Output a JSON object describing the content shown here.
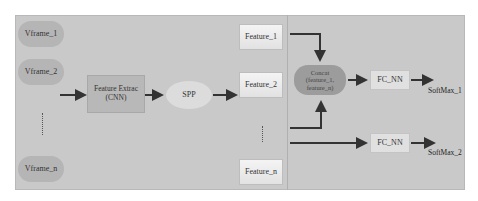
{
  "diagram": {
    "inputs": [
      {
        "label": "Vframe_1"
      },
      {
        "label": "Vframe_2"
      },
      {
        "label": "Vframe_n"
      }
    ],
    "feature_extractor": {
      "line1": "Feature Extrac",
      "line2": "(CNN)"
    },
    "spp": {
      "label": "SPP"
    },
    "features": [
      {
        "label": "Feature_1"
      },
      {
        "label": "Feature_2"
      },
      {
        "label": "Feature_n"
      }
    ],
    "concat": {
      "line1": "Concat",
      "line2": "(feature_1,",
      "line3": "feature_n)"
    },
    "fc_nodes": [
      {
        "label": "FC_NN"
      },
      {
        "label": "FC_NN"
      }
    ],
    "outputs": [
      {
        "label": "SoftMax_1"
      },
      {
        "label": "SoftMax_2"
      }
    ],
    "colors": {
      "canvas": "#c9c9c9",
      "vframe": "#b5b5b5",
      "concat": "#9c9c9c",
      "arrow": "#333333"
    }
  }
}
